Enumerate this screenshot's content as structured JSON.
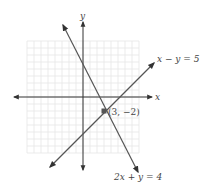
{
  "figure": {
    "type": "coordinate-graph",
    "grid": {
      "xmin": -8,
      "xmax": 8,
      "ymin": -8,
      "ymax": 8,
      "step": 1,
      "color": "#e6e6e6"
    },
    "axes": {
      "x_label": "x",
      "y_label": "y",
      "color": "#333333"
    },
    "lines": [
      {
        "equation": "x − y = 5",
        "slope": 1,
        "intercept": -5,
        "color": "#555555"
      },
      {
        "equation": "2x + y = 4",
        "slope": -2,
        "intercept": 4,
        "color": "#555555"
      }
    ],
    "intersection": {
      "x": 3,
      "y": -2,
      "label": "(3, −2)",
      "color": "#555555"
    }
  },
  "chart_data": {
    "type": "line",
    "title": "",
    "xlabel": "x",
    "ylabel": "y",
    "xlim": [
      -8,
      8
    ],
    "ylim": [
      -8,
      8
    ],
    "grid": true,
    "series": [
      {
        "name": "x − y = 5",
        "x": [
          -5,
          9
        ],
        "y": [
          -10,
          4
        ]
      },
      {
        "name": "2x + y = 4",
        "x": [
          -2.4,
          6
        ],
        "y": [
          8.8,
          -8
        ]
      }
    ],
    "annotations": [
      {
        "text": "(3, −2)",
        "x": 3,
        "y": -2
      },
      {
        "text": "x − y = 5",
        "position": "upper-right of line"
      },
      {
        "text": "2x + y = 4",
        "position": "below lower end of line"
      }
    ]
  }
}
